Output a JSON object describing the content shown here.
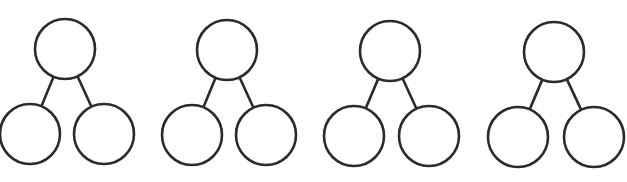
{
  "diagram": {
    "type": "number-bond",
    "count": 4,
    "stroke_color": "#2b2b2b",
    "background": "#ffffff",
    "bonds": [
      {
        "top": {
          "cx": 65,
          "cy": 49,
          "r": 30,
          "value": ""
        },
        "left": {
          "cx": 30,
          "cy": 134,
          "r": 30,
          "value": ""
        },
        "right": {
          "cx": 104,
          "cy": 134,
          "r": 30,
          "value": ""
        }
      },
      {
        "top": {
          "cx": 227,
          "cy": 50,
          "r": 30,
          "value": ""
        },
        "left": {
          "cx": 192,
          "cy": 135,
          "r": 30,
          "value": ""
        },
        "right": {
          "cx": 266,
          "cy": 135,
          "r": 30,
          "value": ""
        }
      },
      {
        "top": {
          "cx": 390,
          "cy": 51,
          "r": 30,
          "value": ""
        },
        "left": {
          "cx": 354,
          "cy": 136,
          "r": 30,
          "value": ""
        },
        "right": {
          "cx": 429,
          "cy": 136,
          "r": 30,
          "value": ""
        }
      },
      {
        "top": {
          "cx": 554,
          "cy": 52,
          "r": 30,
          "value": ""
        },
        "left": {
          "cx": 518,
          "cy": 137,
          "r": 30,
          "value": ""
        },
        "right": {
          "cx": 594,
          "cy": 137,
          "r": 30,
          "value": ""
        }
      }
    ]
  }
}
